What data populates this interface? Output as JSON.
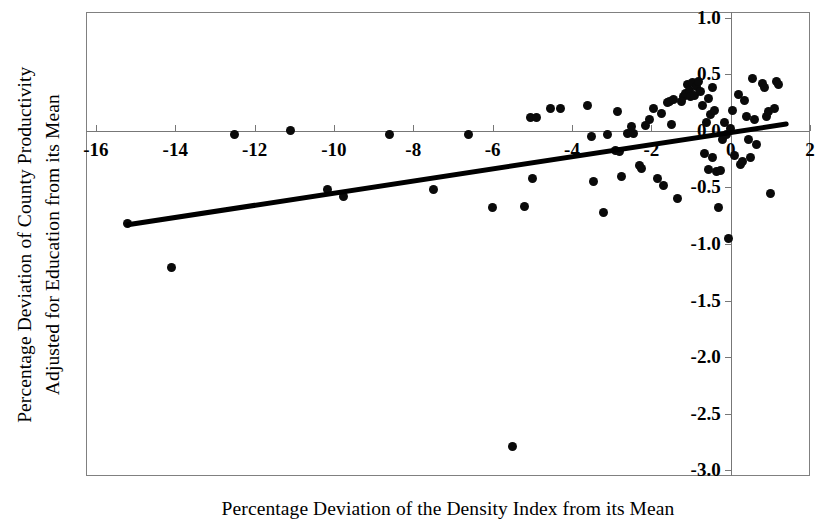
{
  "chart_data": {
    "type": "scatter",
    "title": "",
    "xlabel": "Percentage Deviation of the Density Index from its Mean",
    "ylabel_lines": [
      "Percentage Deviation of County Productivity",
      "Adjusted for Education from its Mean"
    ],
    "ylabel": "Percentage Deviation of County Productivity Adjusted for Education from its Mean",
    "xlim": [
      -16.25,
      2.0
    ],
    "ylim": [
      -3.05,
      1.05
    ],
    "xticks": [
      -16,
      -14,
      -12,
      -10,
      -8,
      -6,
      -4,
      -2,
      0,
      2
    ],
    "xticklabels": [
      "-16",
      "-14",
      "-12",
      "-10",
      "-8",
      "-6",
      "-4",
      "-2",
      "0",
      "2"
    ],
    "yticks": [
      1.0,
      0.5,
      0.0,
      -0.5,
      -1.0,
      -1.5,
      -2.0,
      -2.5,
      -3.0
    ],
    "yticklabels": [
      "1.0",
      "0.5",
      "0.0",
      "-0.5",
      "-1.0",
      "-1.5",
      "-2.0",
      "-2.5",
      "-3.0"
    ],
    "grid": false,
    "legend": "none",
    "marker_color": "#0a0a0a",
    "line_color": "#000000",
    "axis_color": "#777777",
    "zero_line_y": 0.0,
    "zero_line_x": 0.0,
    "trendline": {
      "name": "fitted regression line",
      "x_start": -15.2,
      "y_start": -0.83,
      "x_end": 1.4,
      "y_end": 0.06,
      "slope": 0.0536,
      "intercept": -0.0146
    },
    "points": [
      [
        -15.2,
        -0.82
      ],
      [
        -14.1,
        -1.21
      ],
      [
        -12.5,
        -0.03
      ],
      [
        -11.1,
        0.0
      ],
      [
        -10.15,
        -0.52
      ],
      [
        -9.75,
        -0.58
      ],
      [
        -8.6,
        -0.03
      ],
      [
        -7.5,
        -0.52
      ],
      [
        -6.6,
        -0.03
      ],
      [
        -6.0,
        -0.68
      ],
      [
        -5.5,
        -2.79
      ],
      [
        -5.2,
        -0.67
      ],
      [
        -5.05,
        0.12
      ],
      [
        -5.0,
        -0.42
      ],
      [
        -4.3,
        0.2
      ],
      [
        -3.6,
        0.22
      ],
      [
        -3.5,
        -0.05
      ],
      [
        -3.45,
        -0.45
      ],
      [
        -3.2,
        -0.72
      ],
      [
        -3.1,
        -0.03
      ],
      [
        -2.9,
        -0.17
      ],
      [
        -2.85,
        0.17
      ],
      [
        -2.8,
        -0.18
      ],
      [
        -2.75,
        -0.4
      ],
      [
        -2.6,
        -0.02
      ],
      [
        -2.5,
        0.04
      ],
      [
        -2.45,
        -0.02
      ],
      [
        -2.3,
        -0.31
      ],
      [
        -2.25,
        -0.33
      ],
      [
        -2.05,
        0.1
      ],
      [
        -1.95,
        0.2
      ],
      [
        -1.85,
        -0.42
      ],
      [
        -1.75,
        0.15
      ],
      [
        -1.7,
        -0.48
      ],
      [
        -1.6,
        0.25
      ],
      [
        -1.55,
        0.26
      ],
      [
        -1.5,
        0.06
      ],
      [
        -1.45,
        0.28
      ],
      [
        -1.35,
        -0.6
      ],
      [
        -1.2,
        0.3
      ],
      [
        -1.15,
        0.33
      ],
      [
        -1.1,
        0.41
      ],
      [
        -1.05,
        0.36
      ],
      [
        -1.0,
        0.3
      ],
      [
        -0.95,
        0.43
      ],
      [
        -0.9,
        0.31
      ],
      [
        -0.85,
        0.39
      ],
      [
        -0.8,
        0.44
      ],
      [
        -0.75,
        0.35
      ],
      [
        -0.7,
        0.22
      ],
      [
        -0.65,
        -0.2
      ],
      [
        -0.6,
        0.07
      ],
      [
        -0.55,
        -0.34
      ],
      [
        -0.5,
        0.14
      ],
      [
        -0.45,
        -0.24
      ],
      [
        -0.4,
        0.18
      ],
      [
        -0.35,
        -0.36
      ],
      [
        -0.3,
        -0.68
      ],
      [
        -0.25,
        -0.35
      ],
      [
        -0.2,
        -0.08
      ],
      [
        -0.15,
        0.07
      ],
      [
        -0.1,
        -0.03
      ],
      [
        -0.05,
        -0.95
      ],
      [
        0.0,
        0.02
      ],
      [
        0.05,
        0.18
      ],
      [
        0.1,
        -0.22
      ],
      [
        0.2,
        0.32
      ],
      [
        0.25,
        -0.3
      ],
      [
        0.3,
        -0.27
      ],
      [
        0.35,
        0.27
      ],
      [
        0.4,
        0.13
      ],
      [
        0.45,
        -0.08
      ],
      [
        0.5,
        -0.24
      ],
      [
        0.55,
        0.46
      ],
      [
        0.6,
        0.1
      ],
      [
        0.65,
        -0.12
      ],
      [
        0.8,
        0.42
      ],
      [
        0.85,
        0.38
      ],
      [
        0.9,
        0.13
      ],
      [
        0.95,
        0.17
      ],
      [
        1.0,
        -0.55
      ],
      [
        1.1,
        0.2
      ],
      [
        1.15,
        0.44
      ],
      [
        1.2,
        0.41
      ],
      [
        -4.55,
        0.2
      ],
      [
        -4.9,
        0.12
      ],
      [
        -0.55,
        0.29
      ],
      [
        -0.45,
        0.38
      ],
      [
        -1.25,
        0.26
      ],
      [
        -2.15,
        0.05
      ]
    ]
  }
}
